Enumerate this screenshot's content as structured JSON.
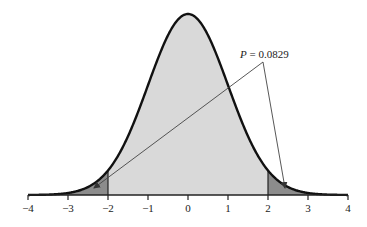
{
  "chart_data": {
    "type": "area",
    "title": "",
    "xlabel": "",
    "ylabel": "",
    "xlim": [
      -4,
      4
    ],
    "x_ticks": [
      -4,
      -3,
      -2,
      -1,
      0,
      1,
      2,
      3,
      4
    ],
    "x_tick_labels": [
      "−4",
      "−3",
      "−2",
      "−1",
      "0",
      "1",
      "2",
      "3",
      "4"
    ],
    "grid": false,
    "legend": null,
    "distribution": {
      "name": "standard normal",
      "mean": 0,
      "sd": 1
    },
    "regions": [
      {
        "name": "left-tail",
        "from": -4,
        "to": -2,
        "fill": "#8c8c8c"
      },
      {
        "name": "center",
        "from": -2,
        "to": 2,
        "fill": "#d9d9d9"
      },
      {
        "name": "right-tail",
        "from": 2,
        "to": 4,
        "fill": "#8c8c8c"
      }
    ],
    "annotations": [
      {
        "text_prefix": "P",
        "text_suffix": " = 0.0829",
        "full_text": "P = 0.0829",
        "points_to": [
          "left-tail",
          "right-tail"
        ]
      }
    ],
    "colors": {
      "curve": "#111111",
      "axis": "#222222",
      "arrow": "#444444"
    }
  }
}
